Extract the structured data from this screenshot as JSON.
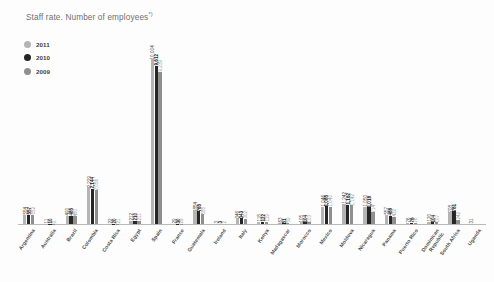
{
  "chart_title": {
    "text": "Staff rate. Number of employees",
    "footnote_marker": "*)"
  },
  "legend": {
    "position": "top-left",
    "entries": [
      {
        "label": "2011",
        "color": "#b4b4b4",
        "icon": "circle-marker"
      },
      {
        "label": "2010",
        "color": "#262626",
        "icon": "circle-marker"
      },
      {
        "label": "2009",
        "color": "#8f8f8f",
        "icon": "circle-marker"
      }
    ]
  },
  "chart_data": {
    "type": "bar",
    "title": "Staff rate. Number of employees*)",
    "xlabel": "",
    "ylabel": "",
    "grid": false,
    "legend_position": "top-left",
    "ylim": [
      0,
      10500
    ],
    "categories": [
      "Argentina",
      "Australia",
      "Brazil",
      "Colombia",
      "Costa Rica",
      "Egypt",
      "Spain",
      "France",
      "Guatemala",
      "Ireland",
      "Italy",
      "Kenya",
      "Madagascar",
      "Morocco",
      "Mexico",
      "Moldova",
      "Nicaragua",
      "Panama",
      "Puerto Rico",
      "Dominican\nRepublic",
      "South Africa",
      "Uganda"
    ],
    "series": [
      {
        "name": "2011",
        "color": "#b4b4b4",
        "values": [
          554,
          11,
          490,
          2229,
          22,
          212,
          10004,
          29,
          854,
          3,
          346,
          118,
          63,
          105,
          1046,
          1242,
          1050,
          557,
          76,
          120,
          708,
          31
        ]
      },
      {
        "name": "2010",
        "color": "#262626",
        "values": [
          557,
          10,
          485,
          2144,
          20,
          210,
          9612,
          30,
          765,
          3,
          343,
          122,
          51,
          104,
          1085,
          1162,
          1018,
          488,
          76,
          104,
          781,
          0
        ]
      },
      {
        "name": "2009",
        "color": "#8f8f8f",
        "values": [
          552,
          9,
          480,
          2056,
          21,
          211,
          9239,
          29,
          585,
          2,
          302,
          119,
          59,
          103,
          1040,
          1142,
          714,
          432,
          76,
          107,
          242,
          0
        ]
      }
    ]
  }
}
